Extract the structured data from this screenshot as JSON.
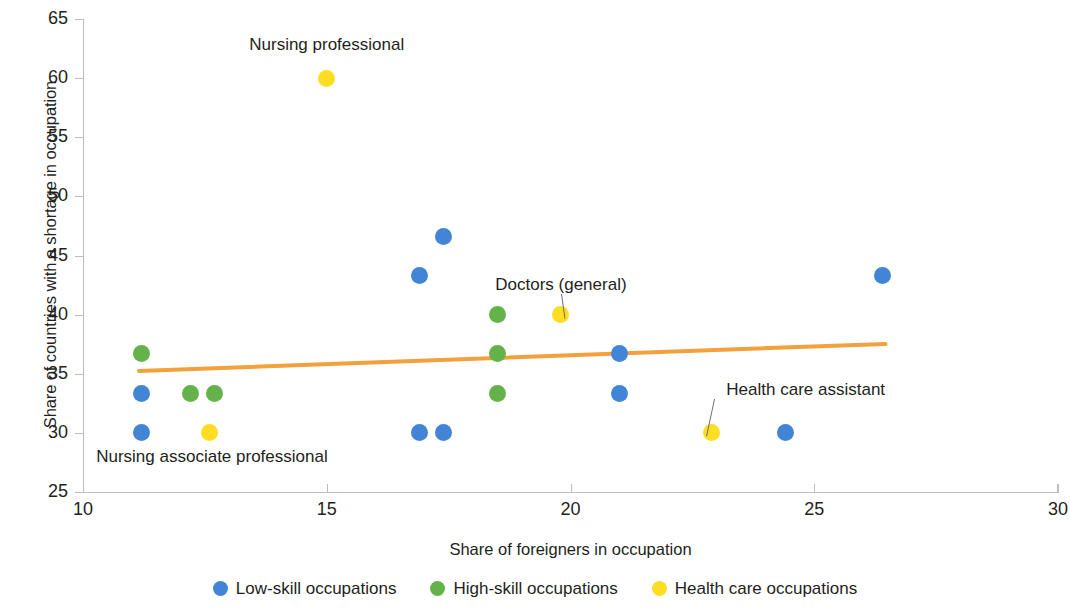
{
  "chart_data": {
    "type": "scatter",
    "title": "",
    "xlabel": "Share of foreigners in occupation",
    "ylabel": "Share of countries with a shortage in occupation",
    "xlim": [
      10,
      30
    ],
    "ylim": [
      25,
      65
    ],
    "xticks": [
      10,
      15,
      20,
      25,
      30
    ],
    "yticks": [
      25,
      30,
      35,
      40,
      45,
      50,
      55,
      60,
      65
    ],
    "grid": false,
    "legend_position": "bottom",
    "series": [
      {
        "name": "Low-skill occupations",
        "color": "#4285d6",
        "points": [
          {
            "x": 11.2,
            "y": 33.3
          },
          {
            "x": 11.2,
            "y": 30.0
          },
          {
            "x": 16.9,
            "y": 43.3
          },
          {
            "x": 17.4,
            "y": 46.6
          },
          {
            "x": 16.9,
            "y": 30.0
          },
          {
            "x": 17.4,
            "y": 30.0
          },
          {
            "x": 21.0,
            "y": 36.7
          },
          {
            "x": 21.0,
            "y": 33.3
          },
          {
            "x": 24.4,
            "y": 30.0
          },
          {
            "x": 26.4,
            "y": 43.3
          }
        ]
      },
      {
        "name": "High-skill occupations",
        "color": "#64b34a",
        "points": [
          {
            "x": 11.2,
            "y": 36.7
          },
          {
            "x": 12.2,
            "y": 33.3
          },
          {
            "x": 12.7,
            "y": 33.3
          },
          {
            "x": 18.5,
            "y": 40.0
          },
          {
            "x": 18.5,
            "y": 36.7
          },
          {
            "x": 18.5,
            "y": 33.3
          }
        ]
      },
      {
        "name": "Health care occupations",
        "color": "#ffdd22",
        "points": [
          {
            "x": 15.0,
            "y": 60.0
          },
          {
            "x": 12.6,
            "y": 30.0
          },
          {
            "x": 19.8,
            "y": 40.0
          },
          {
            "x": 22.9,
            "y": 30.0
          }
        ]
      }
    ],
    "trendline": {
      "color": "#f2a13c",
      "x0": 11.1,
      "y0": 35.2,
      "x1": 26.5,
      "y1": 37.5
    },
    "annotations": [
      {
        "label": "Nursing professional",
        "x": 15.0,
        "y": 62.8,
        "anchor": "center",
        "leader": false
      },
      {
        "label": "Doctors (general)",
        "x": 19.8,
        "y": 42.5,
        "anchor": "center",
        "leader": true
      },
      {
        "label": "Health care assistant",
        "x": 22.95,
        "y": 33.6,
        "anchor": "start",
        "leader": true
      },
      {
        "label": "Nursing associate professional",
        "x": 12.65,
        "y": 28.0,
        "anchor": "center",
        "leader": false
      }
    ]
  },
  "legend": {
    "items": [
      {
        "label": "Low-skill occupations",
        "color": "#4285d6"
      },
      {
        "label": "High-skill occupations",
        "color": "#64b34a"
      },
      {
        "label": "Health care occupations",
        "color": "#ffdd22"
      }
    ]
  },
  "axes": {
    "x_title": "Share of foreigners in occupation",
    "y_title": "Share of countries with a shortage in occupation",
    "x_tick_labels": [
      "10",
      "15",
      "20",
      "25",
      "30"
    ],
    "y_tick_labels": [
      "25",
      "30",
      "35",
      "40",
      "45",
      "50",
      "55",
      "60",
      "65"
    ]
  }
}
